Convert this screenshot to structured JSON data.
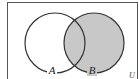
{
  "diagram": {
    "type": "venn",
    "universe_label": "U",
    "sets": [
      {
        "label": "A",
        "shaded": false
      },
      {
        "label": "B",
        "shaded": true
      }
    ],
    "shaded_region": "B",
    "colors": {
      "shade": "#c8c8c8",
      "stroke": "#333333",
      "background": "#ffffff",
      "border": "#555555"
    }
  }
}
